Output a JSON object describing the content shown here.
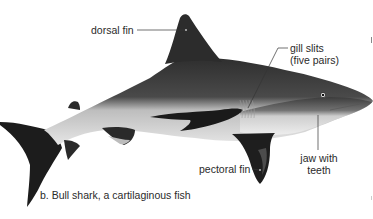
{
  "figure": {
    "subject": "Bull shark",
    "caption": "b. Bull shark, a cartilaginous fish",
    "labels": {
      "dorsal_fin": "dorsal fin",
      "gill_slits_line1": "gill slits",
      "gill_slits_line2": "(five pairs)",
      "pectoral_fin": "pectoral fin",
      "jaw_line1": "jaw with",
      "jaw_line2": "teeth"
    },
    "colors": {
      "background": "#ffffff",
      "shark_dorsal": "#3a3a3a",
      "shark_ventral": "#d8d8d8",
      "shark_dark": "#1a1a1a",
      "label_text": "#2a2a2a",
      "leader_line": "#333333"
    }
  }
}
